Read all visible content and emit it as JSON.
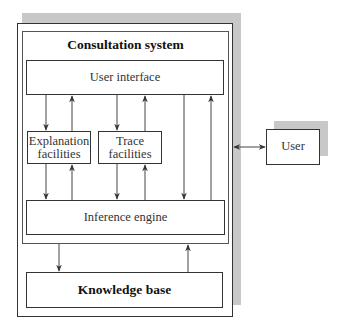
{
  "diagram": {
    "container": {
      "title": "Consultation system"
    },
    "nodes": {
      "user_interface": "User interface",
      "explanation": [
        "Explanation",
        "facilities"
      ],
      "trace": [
        "Trace",
        "facilities"
      ],
      "inference_engine": "Inference engine",
      "knowledge_base": "Knowledge base",
      "user": "User"
    },
    "edges": [
      {
        "from": "User interface",
        "to": "Explanation facilities"
      },
      {
        "from": "Explanation facilities",
        "to": "User interface"
      },
      {
        "from": "User interface",
        "to": "Trace facilities"
      },
      {
        "from": "Trace facilities",
        "to": "User interface"
      },
      {
        "from": "User interface",
        "to": "Inference engine"
      },
      {
        "from": "Inference engine",
        "to": "User interface"
      },
      {
        "from": "Explanation facilities",
        "to": "Inference engine"
      },
      {
        "from": "Inference engine",
        "to": "Explanation facilities"
      },
      {
        "from": "Trace facilities",
        "to": "Inference engine"
      },
      {
        "from": "Inference engine",
        "to": "Trace facilities"
      },
      {
        "from": "Consultation system",
        "to": "Knowledge base"
      },
      {
        "from": "Knowledge base",
        "to": "Consultation system"
      },
      {
        "from": "Expert system",
        "to": "User",
        "bidirectional": true
      }
    ],
    "colors": {
      "line": "#333333",
      "shadow": "#c8c8c8"
    }
  }
}
